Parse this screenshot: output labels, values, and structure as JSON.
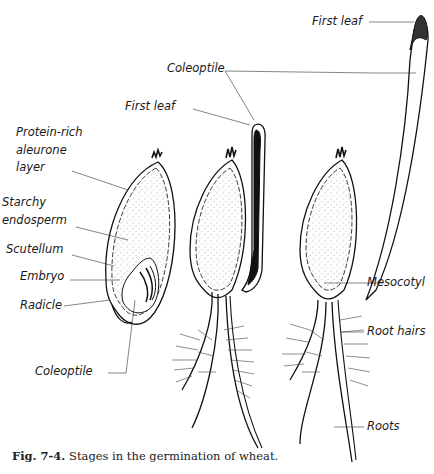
{
  "figure": {
    "caption_number": "Fig. 7-4.",
    "caption_text": " Stages in the germination of wheat.",
    "stages": [
      {
        "name": "seed-section",
        "labels": {
          "aleurone_1": "Protein-rich",
          "aleurone_2": "aleurone",
          "aleurone_3": "layer",
          "endosperm_1": "Starchy",
          "endosperm_2": "endosperm",
          "scutellum": "Scutellum",
          "embryo": "Embryo",
          "radicle": "Radicle",
          "coleoptile": "Coleoptile"
        }
      },
      {
        "name": "early-seedling",
        "labels": {
          "first_leaf": "First leaf",
          "coleoptile": "Coleoptile"
        }
      },
      {
        "name": "older-seedling",
        "labels": {
          "first_leaf": "First leaf",
          "mesocotyl": "Mesocotyl",
          "root_hairs": "Root hairs",
          "roots": "Roots"
        }
      }
    ]
  }
}
